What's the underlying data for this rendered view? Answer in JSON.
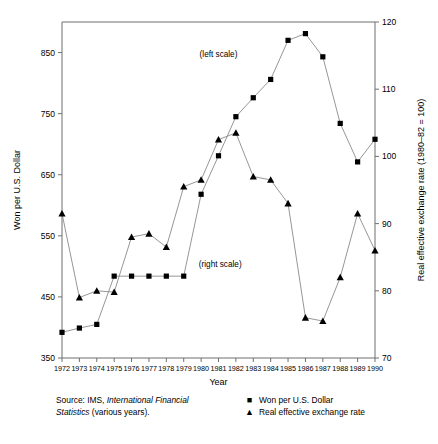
{
  "chart_data": {
    "type": "line",
    "title": "",
    "xlabel": "Year",
    "ylabel": "Won per U.S. Dollar",
    "y2label": "Real effective exchange rate (1980–82 = 100)",
    "grid": false,
    "legend_position": "below-right",
    "xlim": [
      1972,
      1990
    ],
    "ylim": [
      350,
      900
    ],
    "y2lim": [
      70,
      120
    ],
    "yticks": [
      350,
      450,
      550,
      650,
      750,
      850
    ],
    "y2ticks": [
      70,
      80,
      90,
      100,
      110,
      120
    ],
    "categories": [
      1972,
      1973,
      1974,
      1975,
      1976,
      1977,
      1978,
      1979,
      1980,
      1981,
      1982,
      1983,
      1984,
      1985,
      1986,
      1987,
      1988,
      1989,
      1990
    ],
    "xtick_labels": [
      "1972",
      "1973",
      "1974",
      "1975",
      "1976",
      "1977",
      "1978",
      "1979",
      "1980",
      "1981",
      "1982",
      "1983",
      "1984",
      "1985",
      "1986",
      "1987",
      "1988",
      "1989",
      "1990"
    ],
    "series": [
      {
        "name": "Won per U.S. Dollar",
        "axis": "left",
        "marker": "square",
        "annotation": "(left scale)",
        "values": [
          392,
          399,
          405,
          484,
          484,
          484,
          484,
          484,
          618,
          681,
          745,
          776,
          806,
          870,
          881,
          843,
          734,
          671,
          708
        ]
      },
      {
        "name": "Real effective exchange rate",
        "axis": "right",
        "marker": "triangle",
        "annotation": "(right scale)",
        "values": [
          91.5,
          79.0,
          80.0,
          79.8,
          88.0,
          88.5,
          86.5,
          95.5,
          96.5,
          102.5,
          103.5,
          97.0,
          96.5,
          93.0,
          76.0,
          75.5,
          82.0,
          91.5,
          86.0
        ]
      }
    ],
    "annotations": [
      {
        "text": "(left scale)",
        "x": 1981.0,
        "y_px": 57
      },
      {
        "text": "(right scale)",
        "x": 1981.1,
        "y_px": 267
      }
    ]
  },
  "source": {
    "line1_prefix": "Source: IMS, ",
    "line1_italic": "International Financial",
    "line2_italic": "Statistics",
    "line2_suffix": " (various years)."
  },
  "legend": {
    "items": [
      {
        "marker": "■",
        "label": "Won per U.S. Dollar"
      },
      {
        "marker": "▲",
        "label": "Real effective exchange rate"
      }
    ]
  },
  "colors": {
    "axis": "#6f6f6f",
    "line": "#8a8a8a",
    "marker": "#000000",
    "background": "#ffffff"
  }
}
